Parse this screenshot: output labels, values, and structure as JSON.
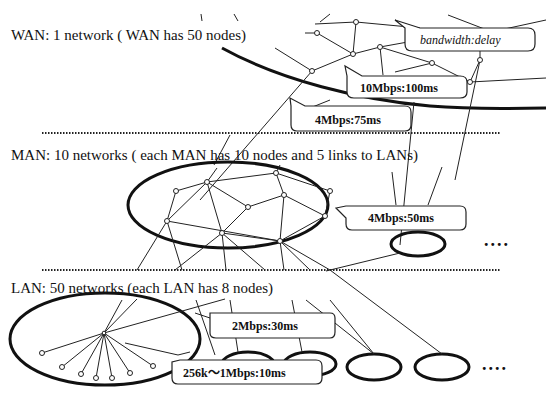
{
  "tiers": {
    "wan": {
      "label": "WAN: 1 network ( WAN has 50 nodes)"
    },
    "man": {
      "label": "MAN: 10 networks ( each MAN has 10 nodes and 5 links to LANs)"
    },
    "lan": {
      "label": "LAN: 50 networks (each LAN has 8 nodes)"
    }
  },
  "callouts": {
    "legend": "bandwidth:delay",
    "wan_internal": "10Mbps:100ms",
    "wan_to_man": "4Mbps:75ms",
    "man_internal": "4Mbps:50ms",
    "man_to_lan": "2Mbps:30ms",
    "lan_internal": "256k〜1Mbps:10ms"
  },
  "ellipsis": {
    "man_more": "....",
    "lan_more": "...."
  },
  "colors": {
    "background": "#ffffff",
    "ink": "#111111"
  }
}
